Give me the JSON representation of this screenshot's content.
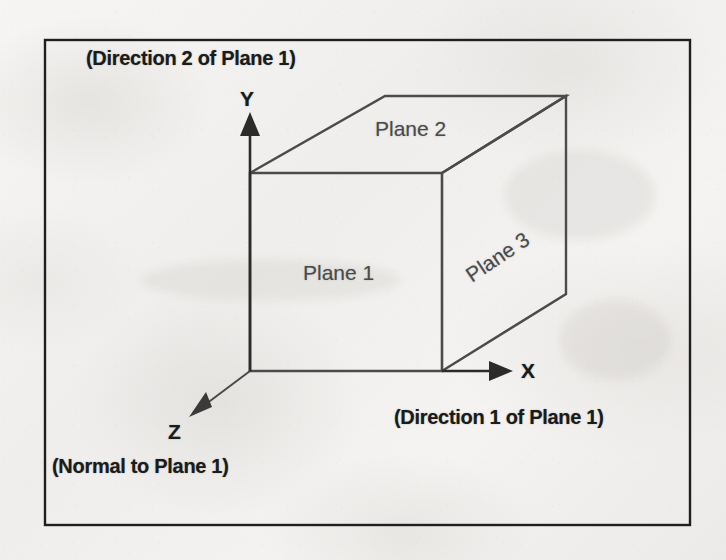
{
  "figure": {
    "background_color": "#f2f1ef",
    "ink_color": "#3a3a3a",
    "frame_color": "#1f1f1f",
    "frame": {
      "x": 45,
      "y": 40,
      "width": 645,
      "height": 485
    },
    "annotations": {
      "direction2": "(Direction 2 of Plane 1)",
      "direction1": "(Direction 1 of Plane 1)",
      "normal": "(Normal to Plane 1)"
    },
    "axes": [
      {
        "name": "y-axis",
        "label": "Y",
        "direction": "up",
        "from": [
          250,
          370
        ],
        "to": [
          250,
          120
        ]
      },
      {
        "name": "x-axis",
        "label": "X",
        "direction": "right",
        "from": [
          442,
          371
        ],
        "to": [
          510,
          371
        ]
      },
      {
        "name": "z-axis",
        "label": "Z",
        "direction": "down-left",
        "from": [
          250,
          370
        ],
        "to": [
          193,
          414
        ]
      }
    ],
    "planes": [
      {
        "name": "plane-1",
        "label": "Plane 1",
        "face": "front",
        "rotation_deg": 0
      },
      {
        "name": "plane-2",
        "label": "Plane 2",
        "face": "top",
        "rotation_deg": 0
      },
      {
        "name": "plane-3",
        "label": "Plane 3",
        "face": "right",
        "rotation_deg": -34
      }
    ],
    "cube": {
      "front_face": {
        "left": 250,
        "top": 173,
        "right": 442,
        "bottom": 371
      },
      "depth_offset": [
        124,
        -77
      ],
      "vertices": {
        "front_top_left": [
          250,
          173
        ],
        "front_top_right": [
          442,
          173
        ],
        "front_bottom_left": [
          250,
          371
        ],
        "front_bottom_right": [
          442,
          371
        ],
        "back_top_left": [
          385,
          96
        ],
        "back_top_right": [
          566,
          96
        ],
        "back_bottom_right": [
          566,
          294
        ]
      }
    }
  }
}
